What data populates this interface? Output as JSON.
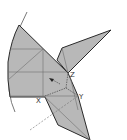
{
  "diagram": {
    "type": "folding-diagram",
    "colors": {
      "fill": "#b8b8b8",
      "outline": "#2a2a2a",
      "crease": "#6e6e6e",
      "arc": "#555555",
      "background": "#ffffff"
    },
    "axis_labels": {
      "x": "X",
      "y": "Y",
      "z": "Z"
    }
  }
}
